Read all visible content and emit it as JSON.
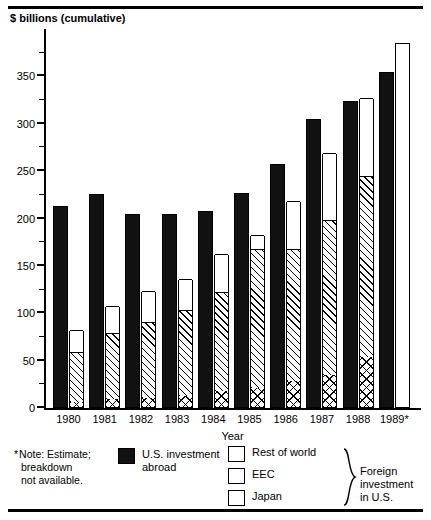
{
  "chart_data": {
    "type": "bar",
    "title": "",
    "subtitle": "",
    "ylabel": "$ billions (cumulative)",
    "xlabel": "Year",
    "categories": [
      "1980",
      "1981",
      "1982",
      "1983",
      "1984",
      "1985",
      "1986",
      "1987",
      "1988",
      "1989*"
    ],
    "ylim": [
      0,
      400
    ],
    "yticks": [
      0,
      50,
      100,
      150,
      200,
      250,
      300,
      350
    ],
    "ytick_labels": [
      "0",
      "50",
      "100",
      "150",
      "200",
      "250",
      "300",
      "350"
    ],
    "minor_tick_step": 25,
    "grid": false,
    "legend_position": "bottom",
    "grouping": "two bars per year: U.S. investment abroad (solid), and foreign investment in U.S. (stacked: Japan, EEC, Rest of world)",
    "series": [
      {
        "name": "U.S. investment abroad",
        "fill": "solid-black",
        "values": [
          213,
          226,
          205,
          205,
          208,
          227,
          258,
          305,
          324,
          355
        ]
      },
      {
        "name": "Japan",
        "fill": "crosshatch",
        "values": [
          5,
          8,
          10,
          12,
          17,
          20,
          27,
          34,
          53,
          null
        ]
      },
      {
        "name": "EEC",
        "fill": "diagonal-hatch",
        "values": [
          53,
          70,
          80,
          90,
          104,
          147,
          140,
          163,
          191,
          null
        ]
      },
      {
        "name": "Rest of world",
        "fill": "white",
        "values": [
          23,
          29,
          32,
          33,
          41,
          15,
          50,
          71,
          82,
          null
        ]
      },
      {
        "name": "Foreign investment in U.S. (total)",
        "fill": "white",
        "values": [
          81,
          107,
          122,
          135,
          162,
          182,
          217,
          268,
          326,
          385
        ]
      }
    ],
    "annotations": [
      "* Note: Estimate; breakdown not available."
    ]
  },
  "axes": {
    "y_title": "$ billions (cumulative)",
    "x_title": "Year",
    "y_labels": [
      "350",
      "300",
      "250",
      "200",
      "150",
      "100",
      "50",
      "0"
    ],
    "x_labels": [
      "1980",
      "1981",
      "1982",
      "1983",
      "1984",
      "1985",
      "1986",
      "1987",
      "1988",
      "1989*"
    ]
  },
  "footer": {
    "note_star": "*",
    "note_line1": "Note: Estimate;",
    "note_line2": "breakdown",
    "note_line3": "not available.",
    "legend": {
      "us_abroad": "U.S. investment abroad",
      "us_abroad_line1": "U.S. investment",
      "us_abroad_line2": "abroad",
      "rest_of_world": "Rest of world",
      "eec": "EEC",
      "japan": "Japan",
      "foreign_line1": "Foreign investment",
      "foreign_line2": "in U.S."
    }
  }
}
